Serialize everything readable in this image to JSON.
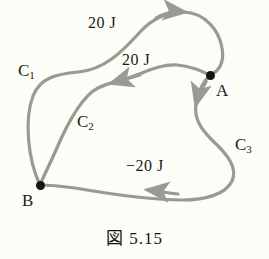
{
  "figure": {
    "caption": "図 5.15",
    "background_color": "#fdfdf7",
    "curve_color": "#9a9a93",
    "ink_color": "#1a1a1a",
    "width": 269,
    "height": 259
  },
  "nodes": [
    {
      "id": "A",
      "label": "A",
      "x": 210,
      "y": 75,
      "label_x": 216,
      "label_y": 82
    },
    {
      "id": "B",
      "label": "B",
      "x": 40,
      "y": 185,
      "label_x": 22,
      "label_y": 192
    }
  ],
  "paths": [
    {
      "id": "C1",
      "label": "C₁",
      "label_text": "C",
      "label_sub": "1",
      "label_x": 18,
      "label_y": 62,
      "energy_label": "20 J",
      "energy_x": 88,
      "energy_y": 15,
      "direction": "B-to-A",
      "arrow_direction": "right"
    },
    {
      "id": "C2",
      "label": "C₂",
      "label_text": "C",
      "label_sub": "2",
      "label_x": 77,
      "label_y": 113,
      "energy_label": "20 J",
      "energy_x": 122,
      "energy_y": 52,
      "direction": "A-to-B",
      "arrow_direction": "left"
    },
    {
      "id": "C3",
      "label": "C₃",
      "label_text": "C",
      "label_sub": "3",
      "label_x": 235,
      "label_y": 136,
      "energy_label": "−20 J",
      "energy_x": 126,
      "energy_y": 158,
      "direction": "A-to-B",
      "arrow_direction": "left"
    }
  ]
}
